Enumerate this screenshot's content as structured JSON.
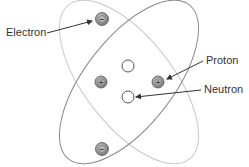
{
  "diagram": {
    "labels": {
      "electron": "Electron",
      "proton": "Proton",
      "neutron": "Neutron"
    },
    "symbols": {
      "electron": "−",
      "proton": "+"
    },
    "colors": {
      "orbit_a": "#c8c8c8",
      "orbit_b": "#8a8a8a",
      "particle_charged": "#8c8c8c",
      "particle_charged_inner": "#b5b5b5",
      "neutron_fill": "#ffffff",
      "stroke": "#555555",
      "arrow": "#333333"
    },
    "particles": {
      "electrons": [
        {
          "cx": 102,
          "cy": 19
        },
        {
          "cx": 102,
          "cy": 149
        }
      ],
      "protons": [
        {
          "cx": 101,
          "cy": 82
        },
        {
          "cx": 158,
          "cy": 82
        }
      ],
      "neutrons": [
        {
          "cx": 128,
          "cy": 66
        },
        {
          "cx": 128,
          "cy": 97
        }
      ]
    }
  }
}
